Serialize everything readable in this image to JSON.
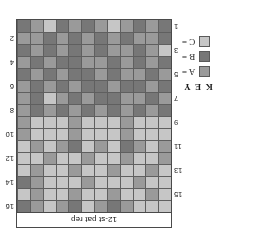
{
  "figure": {
    "orientation": "rotated-180",
    "rep_header_label": "12-st pat rep"
  },
  "key": {
    "title": "K E Y",
    "entries": [
      {
        "label": "A =",
        "color": "#9a9a9a"
      },
      {
        "label": "B =",
        "color": "#777777"
      },
      {
        "label": "C =",
        "color": "#c6c6c6"
      }
    ]
  },
  "chart_data": {
    "type": "heatmap",
    "title": "12-st pat rep",
    "xlabel": "",
    "ylabel": "",
    "columns": 12,
    "rows": 16,
    "legend_position": "left",
    "grid": true,
    "categories": [
      "A",
      "B",
      "C"
    ],
    "category_colors": {
      "A": "#9a9a9a",
      "B": "#777777",
      "C": "#c6c6c6"
    },
    "row_labels_odd": [
      "1",
      "3",
      "5",
      "7",
      "9",
      "11",
      "13",
      "15"
    ],
    "row_labels_even": [
      "2",
      "4",
      "6",
      "8",
      "10",
      "12",
      "14",
      "16"
    ],
    "rows_data": [
      {
        "row": 16,
        "side": "right",
        "label": "16",
        "cells": [
          "C",
          "C",
          "C",
          "A",
          "B",
          "A",
          "C",
          "B",
          "A",
          "C",
          "A",
          "B"
        ]
      },
      {
        "row": 15,
        "side": "left",
        "label": "15",
        "cells": [
          "C",
          "A",
          "C",
          "C",
          "A",
          "C",
          "C",
          "A",
          "C",
          "C",
          "A",
          "C"
        ]
      },
      {
        "row": 14,
        "side": "right",
        "label": "14",
        "cells": [
          "C",
          "C",
          "A",
          "C",
          "C",
          "C",
          "A",
          "C",
          "C",
          "C",
          "A",
          "B"
        ]
      },
      {
        "row": 13,
        "side": "left",
        "label": "13",
        "cells": [
          "C",
          "A",
          "C",
          "C",
          "A",
          "C",
          "C",
          "A",
          "C",
          "C",
          "A",
          "C"
        ]
      },
      {
        "row": 12,
        "side": "right",
        "label": "12",
        "cells": [
          "A",
          "C",
          "C",
          "A",
          "C",
          "C",
          "A",
          "C",
          "C",
          "A",
          "C",
          "C"
        ]
      },
      {
        "row": 11,
        "side": "left",
        "label": "11",
        "cells": [
          "A",
          "C",
          "A",
          "B",
          "C",
          "A",
          "C",
          "B",
          "A",
          "C",
          "A",
          "C"
        ]
      },
      {
        "row": 10,
        "side": "right",
        "label": "10",
        "cells": [
          "C",
          "C",
          "C",
          "A",
          "C",
          "C",
          "C",
          "A",
          "C",
          "C",
          "C",
          "A"
        ]
      },
      {
        "row": 9,
        "side": "left",
        "label": "9",
        "cells": [
          "C",
          "C",
          "C",
          "A",
          "C",
          "C",
          "C",
          "A",
          "C",
          "C",
          "C",
          "A"
        ]
      },
      {
        "row": 8,
        "side": "right",
        "label": "8",
        "cells": [
          "B",
          "A",
          "B",
          "A",
          "B",
          "A",
          "B",
          "A",
          "B",
          "A",
          "B",
          "A"
        ]
      },
      {
        "row": 7,
        "side": "left",
        "label": "7",
        "cells": [
          "A",
          "B",
          "A",
          "A",
          "B",
          "B",
          "A",
          "B",
          "A",
          "C",
          "B",
          "A"
        ]
      },
      {
        "row": 6,
        "side": "right",
        "label": "6",
        "cells": [
          "B",
          "A",
          "B",
          "B",
          "A",
          "B",
          "B",
          "A",
          "B",
          "A",
          "B",
          "A"
        ]
      },
      {
        "row": 5,
        "side": "left",
        "label": "5",
        "cells": [
          "A",
          "B",
          "A",
          "A",
          "B",
          "A",
          "B",
          "B",
          "A",
          "B",
          "A",
          "B"
        ]
      },
      {
        "row": 4,
        "side": "right",
        "label": "4",
        "cells": [
          "B",
          "A",
          "B",
          "A",
          "B",
          "A",
          "A",
          "B",
          "B",
          "A",
          "B",
          "A"
        ]
      },
      {
        "row": 3,
        "side": "left",
        "label": "3",
        "cells": [
          "C",
          "A",
          "B",
          "A",
          "A",
          "B",
          "A",
          "B",
          "A",
          "B",
          "A",
          "B"
        ]
      },
      {
        "row": 2,
        "side": "right",
        "label": "2",
        "cells": [
          "B",
          "A",
          "A",
          "B",
          "A",
          "B",
          "A",
          "B",
          "A",
          "B",
          "A",
          "A"
        ]
      },
      {
        "row": 1,
        "side": "left",
        "label": "1",
        "cells": [
          "B",
          "A",
          "B",
          "A",
          "C",
          "A",
          "B",
          "A",
          "B",
          "C",
          "A",
          "B"
        ]
      }
    ]
  }
}
